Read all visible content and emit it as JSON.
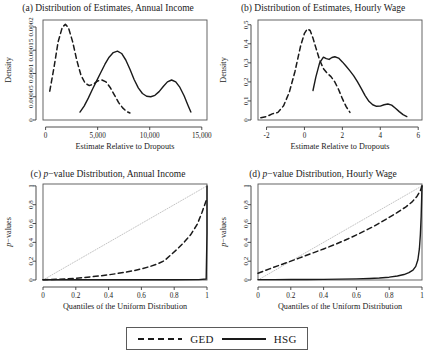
{
  "figure": {
    "legend": {
      "ged_label": "GED",
      "hsg_label": "HSG"
    },
    "footnote": ""
  },
  "chart_data": [
    {
      "id": "panel-a",
      "type": "line",
      "title": "(a) Distribution of Estimates, Annual Income",
      "title_prefix": "(a) Distribution of Estimates, Annual Income",
      "xlabel": "Estimate Relative to Dropouts",
      "ylabel": "Density",
      "xlim": [
        -250,
        15500
      ],
      "ylim": [
        0,
        0.000215
      ],
      "xticks": [
        0,
        5000,
        10000,
        15000
      ],
      "xticklabels": [
        "0",
        "5,000",
        "10,000",
        "15,000"
      ],
      "yticks": [
        0,
        5e-05,
        0.0001,
        0.00015,
        0.0002
      ],
      "yticklabels": [
        "0",
        "0.00005",
        "0.0001",
        "0.00015",
        "0.0002"
      ],
      "grid": false,
      "series": [
        {
          "name": "GED",
          "style": "dashed",
          "color": "#1a1a1a",
          "x": [
            400,
            800,
            1200,
            1600,
            1900,
            2200,
            2600,
            3000,
            3400,
            3800,
            4200,
            4600,
            5000,
            5400,
            5800,
            6200,
            6600,
            7000,
            7400,
            7800,
            8100
          ],
          "y": [
            6.2e-05,
            0.000112,
            0.000168,
            0.000199,
            0.000206,
            0.000198,
            0.000168,
            0.000128,
            9.6e-05,
            7.9e-05,
            7.4e-05,
            7.7e-05,
            8.4e-05,
            8.6e-05,
            8.2e-05,
            7e-05,
            5.4e-05,
            3.8e-05,
            2.6e-05,
            1.8e-05,
            1.5e-05
          ]
        },
        {
          "name": "HSG",
          "style": "solid",
          "color": "#1a1a1a",
          "x": [
            3300,
            3700,
            4100,
            4500,
            4900,
            5300,
            5700,
            6100,
            6500,
            6900,
            7300,
            7700,
            8100,
            8500,
            8900,
            9300,
            9700,
            10100,
            10500,
            10900,
            11300,
            11700,
            12100,
            12500,
            12900,
            13300,
            13700,
            13950
          ],
          "y": [
            1.7e-05,
            3e-05,
            4.7e-05,
            6.6e-05,
            8.4e-05,
            0.000102,
            0.00012,
            0.000135,
            0.000145,
            0.000148,
            0.000143,
            0.000129,
            0.000109,
            8.7e-05,
            6.9e-05,
            5.7e-05,
            5.1e-05,
            5e-05,
            5.3e-05,
            6.1e-05,
            7.2e-05,
            8.2e-05,
            8.6e-05,
            8.2e-05,
            7e-05,
            5.2e-05,
            3e-05,
            1.7e-05
          ]
        }
      ]
    },
    {
      "id": "panel-b",
      "type": "line",
      "title": "(b) Distribution of Estimates, Hourly Wage",
      "xlabel": "Estimate Relative to Dropouts",
      "ylabel": "Density",
      "xlim": [
        -2.45,
        6.2
      ],
      "ylim": [
        0,
        0.525
      ],
      "xticks": [
        -2,
        0,
        2,
        4,
        6
      ],
      "xticklabels": [
        "-2",
        "0",
        "2",
        "4",
        "6"
      ],
      "yticks": [
        0,
        0.1,
        0.2,
        0.3,
        0.4,
        0.5
      ],
      "yticklabels": [
        "0",
        "0.1",
        "0.2",
        "0.3",
        "0.4",
        "0.5"
      ],
      "grid": false,
      "series": [
        {
          "name": "GED",
          "style": "dashed",
          "color": "#1a1a1a",
          "x": [
            -2.3,
            -2.0,
            -1.7,
            -1.4,
            -1.1,
            -0.8,
            -0.5,
            -0.2,
            0.0,
            0.15,
            0.3,
            0.45,
            0.6,
            0.8,
            1.0,
            1.2,
            1.4,
            1.6,
            1.8,
            2.0,
            2.2,
            2.4
          ],
          "y": [
            0.012,
            0.018,
            0.032,
            0.04,
            0.075,
            0.145,
            0.255,
            0.39,
            0.455,
            0.478,
            0.47,
            0.43,
            0.38,
            0.315,
            0.27,
            0.245,
            0.228,
            0.2,
            0.16,
            0.112,
            0.07,
            0.04
          ]
        },
        {
          "name": "HSG",
          "style": "solid",
          "color": "#1a1a1a",
          "x": [
            0.45,
            0.6,
            0.8,
            1.0,
            1.15,
            1.3,
            1.45,
            1.6,
            1.8,
            2.0,
            2.2,
            2.4,
            2.6,
            2.8,
            3.0,
            3.2,
            3.4,
            3.6,
            3.8,
            4.0,
            4.2,
            4.4,
            4.6,
            4.8,
            5.0,
            5.2,
            5.4
          ],
          "y": [
            0.155,
            0.225,
            0.3,
            0.33,
            0.322,
            0.318,
            0.328,
            0.332,
            0.325,
            0.305,
            0.282,
            0.258,
            0.232,
            0.2,
            0.165,
            0.128,
            0.098,
            0.08,
            0.072,
            0.073,
            0.08,
            0.084,
            0.078,
            0.062,
            0.044,
            0.028,
            0.018
          ]
        },
        {
          "name": "reference-diagonal",
          "style": "none",
          "color": "#bdbdbd",
          "x": [],
          "y": []
        }
      ]
    },
    {
      "id": "panel-c",
      "type": "line",
      "title": "(c) p−value Distribution, Annual Income",
      "title_marker": "(c) ",
      "title_italic": "p",
      "title_rest": "−value Distribution, Annual Income",
      "xlabel": "Quantiles of the Uniform Distribution",
      "ylabel": "p−values",
      "xlim": [
        0,
        1
      ],
      "ylim": [
        0,
        1.02
      ],
      "xticks": [
        0,
        0.2,
        0.4,
        0.6,
        0.8,
        1
      ],
      "xticklabels": [
        "0",
        "0.2",
        "0.4",
        "0.6",
        "0.8",
        "1"
      ],
      "yticks": [
        0,
        0.2,
        0.4,
        0.6,
        0.8,
        1
      ],
      "yticklabels": [
        "0",
        "0.2",
        "0.4",
        "0.6",
        "0.8",
        "1"
      ],
      "grid": false,
      "series": [
        {
          "name": "reference",
          "style": "dotted",
          "color": "#c4c4c4",
          "x": [
            0,
            1
          ],
          "y": [
            0,
            1
          ]
        },
        {
          "name": "GED",
          "style": "dashed",
          "color": "#1a1a1a",
          "x": [
            0.0,
            0.05,
            0.1,
            0.15,
            0.2,
            0.25,
            0.3,
            0.35,
            0.4,
            0.45,
            0.5,
            0.55,
            0.6,
            0.65,
            0.7,
            0.74,
            0.78,
            0.82,
            0.86,
            0.9,
            0.94,
            0.97,
            1.0
          ],
          "y": [
            0.003,
            0.005,
            0.008,
            0.012,
            0.018,
            0.026,
            0.035,
            0.044,
            0.055,
            0.068,
            0.082,
            0.098,
            0.118,
            0.142,
            0.172,
            0.205,
            0.268,
            0.33,
            0.4,
            0.48,
            0.59,
            0.72,
            0.87
          ]
        },
        {
          "name": "HSG",
          "style": "solid",
          "color": "#1a1a1a",
          "x": [
            0.0,
            0.2,
            0.4,
            0.6,
            0.8,
            0.95,
            0.995,
            1.0,
            1.0
          ],
          "y": [
            0.002,
            0.002,
            0.002,
            0.002,
            0.003,
            0.004,
            0.01,
            0.5,
            1.0
          ]
        }
      ]
    },
    {
      "id": "panel-d",
      "type": "line",
      "title": "(d) p−value Distribution, Hourly Wage",
      "title_marker": "(d) ",
      "title_italic": "p",
      "title_rest": "−value Distribution, Hourly Wage",
      "xlabel": "Quantiles of the Uniform Distribution",
      "ylabel": "p−values",
      "xlim": [
        0,
        1
      ],
      "ylim": [
        0,
        1.02
      ],
      "xticks": [
        0,
        0.2,
        0.4,
        0.6,
        0.8,
        1
      ],
      "xticklabels": [
        "0",
        "0.2",
        "0.4",
        "0.6",
        "0.8",
        "1"
      ],
      "yticks": [
        0,
        0.2,
        0.4,
        0.6,
        0.8,
        1
      ],
      "yticklabels": [
        "0",
        "0.2",
        "0.4",
        "0.6",
        "0.8",
        "1"
      ],
      "grid": false,
      "series": [
        {
          "name": "reference",
          "style": "dotted",
          "color": "#c4c4c4",
          "x": [
            0,
            1
          ],
          "y": [
            0,
            1
          ]
        },
        {
          "name": "GED",
          "style": "dashed",
          "color": "#1a1a1a",
          "x": [
            0.0,
            0.03,
            0.07,
            0.12,
            0.18,
            0.25,
            0.32,
            0.4,
            0.48,
            0.55,
            0.62,
            0.7,
            0.78,
            0.85,
            0.9,
            0.94,
            0.97,
            0.99,
            1.0
          ],
          "y": [
            0.072,
            0.092,
            0.118,
            0.15,
            0.188,
            0.232,
            0.278,
            0.33,
            0.385,
            0.438,
            0.495,
            0.565,
            0.645,
            0.718,
            0.775,
            0.83,
            0.89,
            0.95,
            1.0
          ]
        },
        {
          "name": "HSG",
          "style": "solid",
          "color": "#1a1a1a",
          "x": [
            0.0,
            0.1,
            0.2,
            0.3,
            0.4,
            0.5,
            0.6,
            0.68,
            0.74,
            0.8,
            0.85,
            0.89,
            0.92,
            0.945,
            0.962,
            0.975,
            0.984,
            0.99,
            0.995,
            0.998,
            1.0
          ],
          "y": [
            0.004,
            0.004,
            0.005,
            0.006,
            0.007,
            0.009,
            0.012,
            0.016,
            0.021,
            0.03,
            0.042,
            0.058,
            0.078,
            0.105,
            0.145,
            0.215,
            0.33,
            0.48,
            0.68,
            0.87,
            1.0
          ]
        }
      ]
    }
  ]
}
